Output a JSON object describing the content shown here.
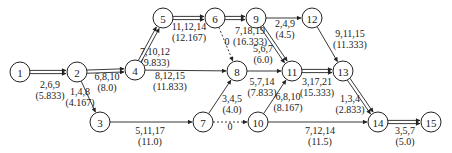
{
  "nodes": [
    {
      "id": "1",
      "x": 20,
      "y": 72
    },
    {
      "id": "2",
      "x": 77,
      "y": 72
    },
    {
      "id": "3",
      "x": 100,
      "y": 122
    },
    {
      "id": "4",
      "x": 135,
      "y": 70
    },
    {
      "id": "5",
      "x": 163,
      "y": 18
    },
    {
      "id": "6",
      "x": 215,
      "y": 18
    },
    {
      "id": "7",
      "x": 203,
      "y": 122
    },
    {
      "id": "8",
      "x": 237,
      "y": 71
    },
    {
      "id": "9",
      "x": 256,
      "y": 18
    },
    {
      "id": "10",
      "x": 258,
      "y": 122
    },
    {
      "id": "11",
      "x": 292,
      "y": 71
    },
    {
      "id": "12",
      "x": 312,
      "y": 18
    },
    {
      "id": "13",
      "x": 343,
      "y": 71
    },
    {
      "id": "14",
      "x": 378,
      "y": 122
    },
    {
      "id": "15",
      "x": 431,
      "y": 122
    }
  ],
  "edges": [
    {
      "from": "1",
      "to": "2",
      "estimates": "2,6,9",
      "expected": "(5.833)",
      "critical": true,
      "lx": 50,
      "ly": 88
    },
    {
      "from": "2",
      "to": "4",
      "estimates": "6,8,10",
      "expected": "(8.0)",
      "critical": true,
      "lx": 107,
      "ly": 80
    },
    {
      "from": "2",
      "to": "3",
      "estimates": "1,4,8",
      "expected": "(4.167)",
      "critical": false,
      "lx": 80,
      "ly": 95
    },
    {
      "from": "4",
      "to": "5",
      "estimates": "7,10,12",
      "expected": "(9.833)",
      "critical": true,
      "lx": 155,
      "ly": 55
    },
    {
      "from": "4",
      "to": "8",
      "estimates": "8,12,15",
      "expected": "(11.833)",
      "critical": false,
      "lx": 170,
      "ly": 79
    },
    {
      "from": "5",
      "to": "6",
      "estimates": "11,12,14",
      "expected": "(12.167)",
      "critical": true,
      "lx": 189,
      "ly": 30
    },
    {
      "from": "6",
      "to": "9",
      "estimates": "",
      "expected": "",
      "critical": true,
      "lx": 0,
      "ly": 0
    },
    {
      "from": "6",
      "to": "8",
      "estimates": "0",
      "expected": "",
      "critical": false,
      "dummy": true,
      "lx": 227,
      "ly": 45
    },
    {
      "from": "3",
      "to": "7",
      "estimates": "5,11,17",
      "expected": "(11.0)",
      "critical": false,
      "lx": 150,
      "ly": 134
    },
    {
      "from": "7",
      "to": "8",
      "estimates": "3,4,5",
      "expected": "(4.0)",
      "critical": false,
      "lx": 232,
      "ly": 102
    },
    {
      "from": "7",
      "to": "10",
      "estimates": "0",
      "expected": "",
      "critical": false,
      "dummy": true,
      "lx": 230,
      "ly": 130
    },
    {
      "from": "8",
      "to": "11",
      "estimates": "5,7,14",
      "expected": "(7.833)",
      "critical": false,
      "lx": 262,
      "ly": 85
    },
    {
      "from": "9",
      "to": "11",
      "estimates": "5,6,7",
      "expected": "(6.0)",
      "critical": true,
      "lx": 263,
      "ly": 52
    },
    {
      "from": "9",
      "to": "12",
      "estimates": "2,4,9",
      "expected": "(4.5)",
      "critical": false,
      "lx": 285,
      "ly": 27
    },
    {
      "from": "6",
      "to": "9",
      "estimates": "7,18,19",
      "expected": "(16.333)",
      "critical": false,
      "label_only": true,
      "lx": 250,
      "ly": 34
    },
    {
      "from": "10",
      "to": "11",
      "estimates": "6,8,10",
      "expected": "(8.167)",
      "critical": false,
      "lx": 288,
      "ly": 100
    },
    {
      "from": "10",
      "to": "14",
      "estimates": "7,12,14",
      "expected": "(11.5)",
      "critical": false,
      "lx": 320,
      "ly": 134
    },
    {
      "from": "11",
      "to": "13",
      "estimates": "3,17,21",
      "expected": "(15.333)",
      "critical": true,
      "lx": 317,
      "ly": 85
    },
    {
      "from": "12",
      "to": "13",
      "estimates": "9,11,15",
      "expected": "(11.333)",
      "critical": false,
      "lx": 350,
      "ly": 37
    },
    {
      "from": "13",
      "to": "14",
      "estimates": "1,3,4",
      "expected": "(2.833)",
      "critical": true,
      "lx": 350,
      "ly": 102
    },
    {
      "from": "14",
      "to": "15",
      "estimates": "3,5,7",
      "expected": "(5.0)",
      "critical": true,
      "lx": 405,
      "ly": 134
    }
  ],
  "node_radius": 10,
  "colors": {
    "stroke": "#222222",
    "background": "#ffffff"
  }
}
